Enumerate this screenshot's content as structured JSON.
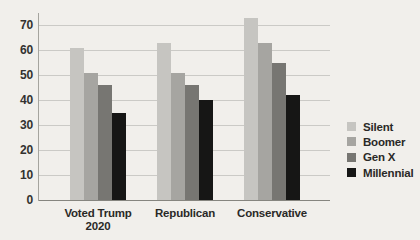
{
  "figure": {
    "background": "#f1efeb"
  },
  "chart_data": {
    "type": "bar",
    "categories": [
      "Voted Trump 2020",
      "Republican",
      "Conservative"
    ],
    "series": [
      {
        "name": "Silent",
        "color": "#c6c5c1",
        "values": [
          61,
          63,
          73
        ]
      },
      {
        "name": "Boomer",
        "color": "#a6a5a1",
        "values": [
          51,
          51,
          63
        ]
      },
      {
        "name": "Gen X",
        "color": "#777672",
        "values": [
          46,
          46,
          55
        ]
      },
      {
        "name": "Millennial",
        "color": "#161615",
        "values": [
          35,
          40,
          42
        ]
      }
    ],
    "ylim": [
      0,
      70
    ],
    "yticks": [
      0,
      10,
      20,
      30,
      40,
      50,
      60,
      70
    ],
    "grid": true,
    "legend": {
      "position": "right",
      "entries": [
        "Silent",
        "Boomer",
        "Gen X",
        "Millennial"
      ]
    }
  }
}
